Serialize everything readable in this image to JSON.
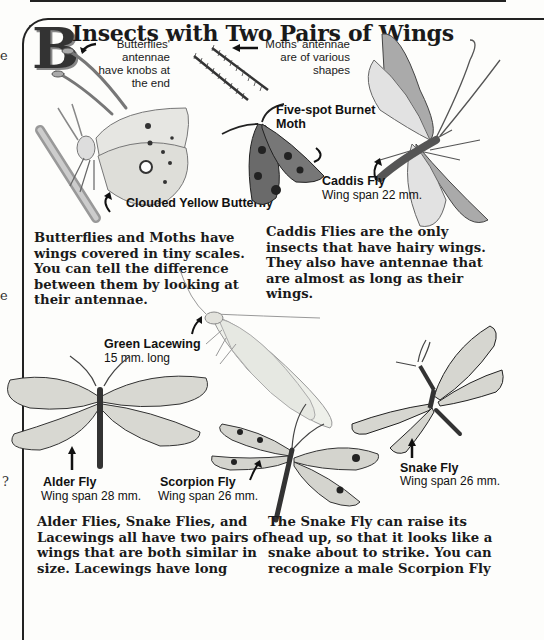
{
  "page": {
    "section_letter": "B",
    "title": "Insects with Two Pairs of Wings",
    "left_margin_glyphs": [
      "e",
      "e",
      "?"
    ],
    "callouts": {
      "butterfly_antennae": "Butterflies' antennae have knobs at the end",
      "moth_antennae": "Moths' antennae are of various shapes"
    },
    "specimens": [
      {
        "name": "Clouded Yellow Butterfly",
        "detail": ""
      },
      {
        "name": "Five-spot Burnet Moth",
        "detail": ""
      },
      {
        "name": "Caddis Fly",
        "detail": "Wing span 22 mm."
      },
      {
        "name": "Green Lacewing",
        "detail": "15 mm. long"
      },
      {
        "name": "Alder Fly",
        "detail": "Wing span 28 mm."
      },
      {
        "name": "Scorpion Fly",
        "detail": "Wing span 26 mm."
      },
      {
        "name": "Snake Fly",
        "detail": "Wing span 26 mm."
      }
    ],
    "paragraphs": {
      "butterflies_moths": "Butterflies and Moths have wings covered in tiny scales. You can tell the difference between them by looking at their antennae.",
      "caddis": "Caddis Flies are the only insects that have hairy wings. They also have antennae that are almost as long as their wings.",
      "alder_snake_lacewing": "Alder Flies, Snake Flies, and Lacewings all have two pairs of wings that are both similar in size. Lacewings have long",
      "snake_scorpion": "The Snake Fly can raise its head up, so that it looks like a snake about to strike. You can recognize a male Scorpion Fly"
    }
  }
}
